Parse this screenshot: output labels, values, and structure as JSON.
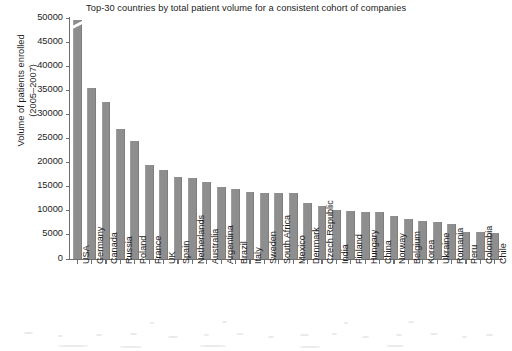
{
  "chart_data": {
    "type": "bar",
    "title": "Top-30 countries by total patient volume for a consistent cohort of companies",
    "xlabel": "",
    "ylabel": "Volume of patients enrolled (2005–2007)",
    "ylabel_line1": "Volume of patients enrolled",
    "ylabel_line2": "(2005–2007)",
    "ylim": [
      0,
      50000
    ],
    "ytick_step": 5000,
    "ytick_labels": [
      "0",
      "5000",
      "10000",
      "15000",
      "20000",
      "25000",
      "30000",
      "35000",
      "40000",
      "45000",
      "50000"
    ],
    "ytick_values": [
      0,
      5000,
      10000,
      15000,
      20000,
      25000,
      30000,
      35000,
      40000,
      45000,
      50000
    ],
    "grid": false,
    "legend": "none",
    "axis_break": true,
    "axis_break_note": "bar for USA is clipped at the top of the axis",
    "bar_color": "#8e8e8e",
    "axis_color": "#6e6e6e",
    "text_color": "#1d1d1d",
    "background": "#ffffff",
    "categories": [
      "USA",
      "Germany",
      "Canada",
      "Russia",
      "Poland",
      "France",
      "UK",
      "Spain",
      "Netherlands",
      "Australia",
      "Argentina",
      "Brazil",
      "Italy",
      "Sweden",
      "South Africa",
      "Mexico",
      "Denmark",
      "Czech Republic",
      "India",
      "Finland",
      "Hungary",
      "China",
      "Norway",
      "Belgium",
      "Korea",
      "Ukraine",
      "Romania",
      "Peru",
      "Colombia",
      "Chile"
    ],
    "values": [
      49500,
      35500,
      32500,
      27000,
      24500,
      19500,
      18500,
      17000,
      16800,
      16000,
      15000,
      14500,
      13800,
      13700,
      13700,
      13600,
      11700,
      11000,
      10200,
      9900,
      9800,
      9700,
      9000,
      8300,
      7800,
      7700,
      7200,
      5700,
      5600,
      5500
    ]
  }
}
